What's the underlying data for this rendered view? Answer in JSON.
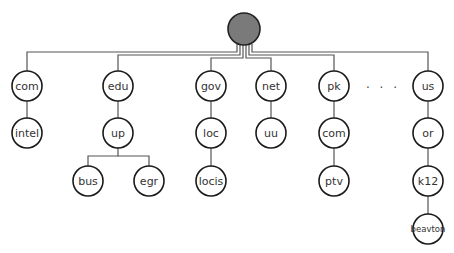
{
  "diagram": {
    "type": "tree",
    "root": {
      "label": "",
      "fill": "#7a7a7a"
    },
    "ellipsis": ". . .",
    "nodes": {
      "com": "com",
      "intel": "intel",
      "edu": "edu",
      "up": "up",
      "bus": "bus",
      "egr": "egr",
      "gov": "gov",
      "loc": "loc",
      "locis": "locis",
      "net": "net",
      "uu": "uu",
      "pk": "pk",
      "pk_com": "com",
      "ptv": "ptv",
      "us": "us",
      "or": "or",
      "k12": "k12",
      "beavton": "beavton"
    }
  }
}
